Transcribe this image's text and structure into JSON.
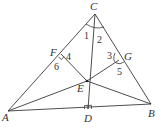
{
  "diagram": {
    "type": "geometry",
    "points": {
      "A": {
        "label": "A",
        "x": 8,
        "y": 111,
        "lx": 2,
        "ly": 121
      },
      "B": {
        "label": "B",
        "x": 151,
        "y": 104,
        "lx": 148,
        "ly": 117
      },
      "C": {
        "label": "C",
        "x": 95,
        "y": 14,
        "lx": 90,
        "ly": 10
      },
      "D": {
        "label": "D",
        "x": 88,
        "y": 109,
        "lx": 84,
        "ly": 122
      },
      "E": {
        "label": "E",
        "x": 87,
        "y": 81,
        "lx": 77,
        "ly": 92
      },
      "F": {
        "label": "F",
        "x": 61,
        "y": 54,
        "lx": 50,
        "ly": 56
      },
      "G": {
        "label": "G",
        "x": 119,
        "y": 60,
        "lx": 124,
        "ly": 60
      }
    },
    "angles": [
      {
        "label": "1",
        "x": 84,
        "y": 39
      },
      {
        "label": "2",
        "x": 97,
        "y": 43
      },
      {
        "label": "3",
        "x": 108,
        "y": 59
      },
      {
        "label": "4",
        "x": 66,
        "y": 60
      },
      {
        "label": "5",
        "x": 117,
        "y": 74
      },
      {
        "label": "6",
        "x": 55,
        "y": 70
      }
    ],
    "segments": [
      "AB",
      "BC",
      "CA",
      "CD",
      "EF",
      "EG",
      "EA",
      "EB"
    ],
    "right_angles": [
      "D",
      "F"
    ]
  }
}
